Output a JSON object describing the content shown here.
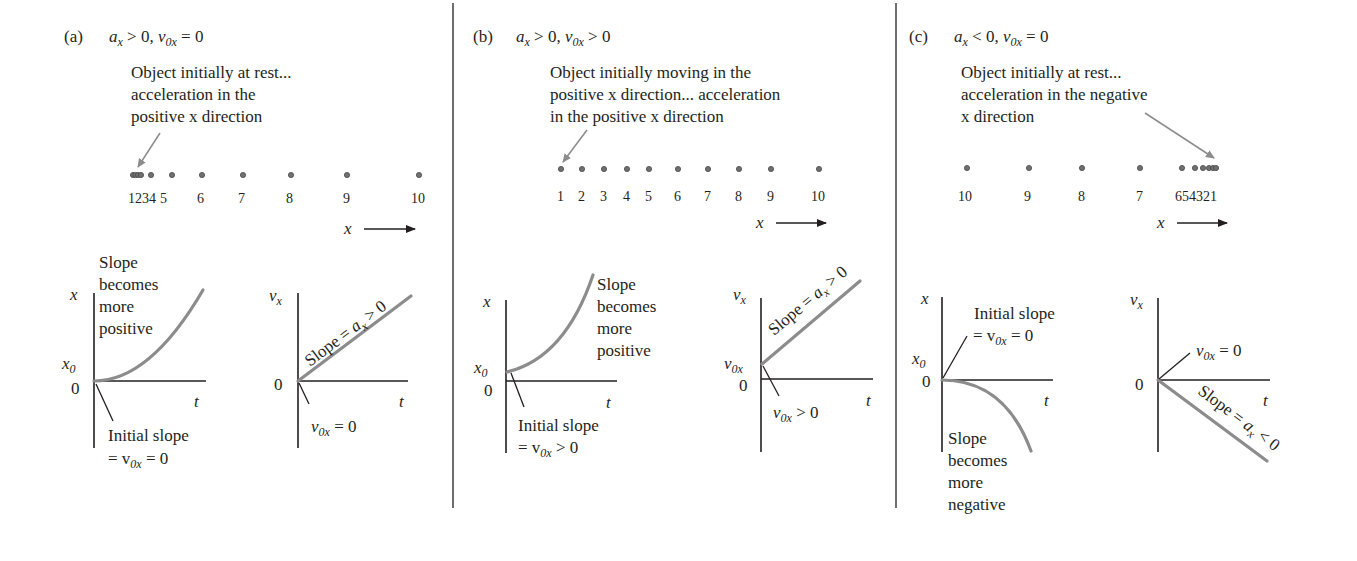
{
  "figure": {
    "colors": {
      "ink": "#231f20",
      "curve": "#8c8c8c",
      "dot": "#6f6f6f",
      "background": "#ffffff"
    },
    "panels": [
      {
        "id": "a",
        "label": "(a)",
        "condition": {
          "a_sym": "a",
          "a_sub": "x",
          "a_rel": " > 0, ",
          "v_sym": "v",
          "v_sub": "0x",
          "v_rel": " = 0"
        },
        "description": [
          "Object initially at rest...",
          "acceleration in the",
          "positive x direction"
        ],
        "motion": {
          "labels": [
            "1",
            "2",
            "3",
            "4",
            "5",
            "6",
            "7",
            "8",
            "9",
            "10"
          ],
          "label_text": "1234 5    6     7       8        9          10",
          "axis_label": "x"
        },
        "xt_graph": {
          "y_axis_label": "x",
          "x_axis_label": "t",
          "x0_label": "x",
          "x0_sub": "0",
          "zero_label": "0",
          "curve_annotation": [
            "Slope",
            "becomes",
            "more",
            "positive"
          ],
          "initial_annotation": [
            "Initial slope",
            "= v",
            "0x",
            " = 0"
          ]
        },
        "vt_graph": {
          "y_axis_label": "v",
          "y_axis_sub": "x",
          "x_axis_label": "t",
          "zero_label": "0",
          "slope_annotation": {
            "pre": "Slope = ",
            "a": "a",
            "sub": "x",
            "post": " > 0"
          },
          "initial_annotation": {
            "v": "v",
            "sub": "0x",
            "post": " = 0"
          }
        }
      },
      {
        "id": "b",
        "label": "(b)",
        "condition": {
          "a_sym": "a",
          "a_sub": "x",
          "a_rel": " > 0, ",
          "v_sym": "v",
          "v_sub": "0x",
          "v_rel": " > 0"
        },
        "description": [
          "Object initially moving in the",
          "positive x direction... acceleration",
          "in the positive x direction"
        ],
        "motion": {
          "labels": [
            "1",
            "2",
            "3",
            "4",
            "5",
            "6",
            "7",
            "8",
            "9",
            "10"
          ],
          "axis_label": "x"
        },
        "xt_graph": {
          "y_axis_label": "x",
          "x_axis_label": "t",
          "x0_label": "x",
          "x0_sub": "0",
          "zero_label": "0",
          "curve_annotation": [
            "Slope",
            "becomes",
            "more",
            "positive"
          ],
          "initial_annotation": [
            "Initial slope",
            "= v",
            "0x",
            " > 0"
          ]
        },
        "vt_graph": {
          "y_axis_label": "v",
          "y_axis_sub": "x",
          "x_axis_label": "t",
          "v0_label": "v",
          "v0_sub": "0x",
          "zero_label": "0",
          "slope_annotation": {
            "pre": "Slope = ",
            "a": "a",
            "sub": "x",
            "post": " > 0"
          },
          "initial_annotation": {
            "v": "v",
            "sub": "0x",
            "post": " > 0"
          }
        }
      },
      {
        "id": "c",
        "label": "(c)",
        "condition": {
          "a_sym": "a",
          "a_sub": "x",
          "a_rel": " < 0, ",
          "v_sym": "v",
          "v_sub": "0x",
          "v_rel": " = 0"
        },
        "description": [
          "Object initially at rest...",
          "acceleration in the negative",
          "x direction"
        ],
        "motion": {
          "labels": [
            "10",
            "9",
            "8",
            "7",
            "6",
            "5",
            "4",
            "3",
            "2",
            "1"
          ],
          "label_text": "654321",
          "axis_label": "x"
        },
        "xt_graph": {
          "y_axis_label": "x",
          "x_axis_label": "t",
          "x0_label": "x",
          "x0_sub": "0",
          "zero_label": "0",
          "curve_annotation": [
            "Slope",
            "becomes",
            "more",
            "negative"
          ],
          "initial_annotation": [
            "Initial slope",
            "= v",
            "0x",
            " = 0"
          ]
        },
        "vt_graph": {
          "y_axis_label": "v",
          "y_axis_sub": "x",
          "x_axis_label": "t",
          "zero_label": "0",
          "slope_annotation": {
            "pre": "Slope = ",
            "a": "a",
            "sub": "x",
            "post": " < 0"
          },
          "initial_annotation": {
            "v": "v",
            "sub": "0x",
            "post": " = 0"
          }
        }
      }
    ]
  }
}
